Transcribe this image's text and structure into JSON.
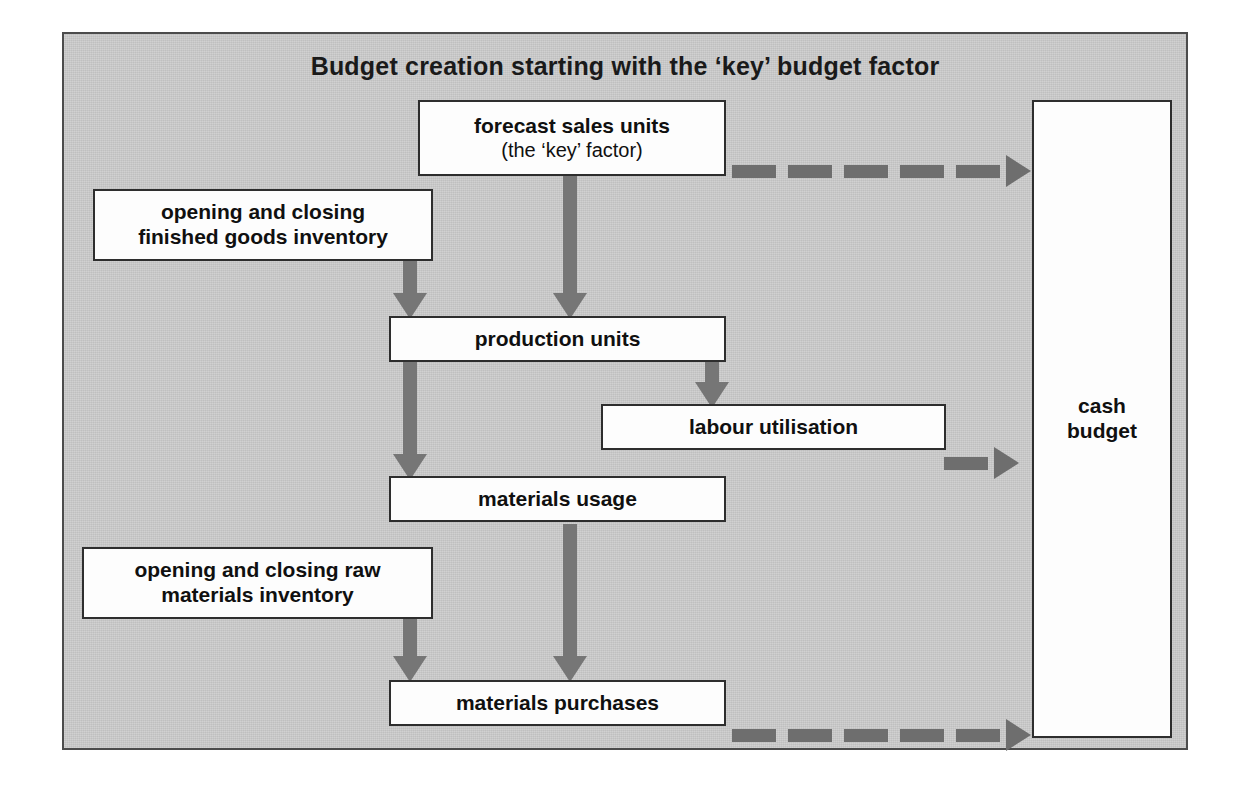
{
  "diagram": {
    "title": "Budget creation starting with the ‘key’ budget factor",
    "type": "flowchart",
    "nodes": {
      "forecast_sales": {
        "line1": "forecast sales units",
        "line2": "(the ‘key’ factor)"
      },
      "fg_inventory": {
        "line1": "opening and closing",
        "line2": "finished goods inventory"
      },
      "production_units": {
        "label": "production units"
      },
      "labour_utilisation": {
        "label": "labour utilisation"
      },
      "materials_usage": {
        "label": "materials usage"
      },
      "rm_inventory": {
        "line1": "opening and closing raw",
        "line2": "materials inventory"
      },
      "materials_purchases": {
        "label": "materials purchases"
      },
      "cash_budget": {
        "line1": "cash",
        "line2": "budget"
      }
    },
    "edges": [
      {
        "from": "forecast_sales",
        "to": "cash_budget",
        "style": "dashed",
        "direction": "right"
      },
      {
        "from": "forecast_sales",
        "to": "production_units",
        "style": "solid",
        "direction": "down"
      },
      {
        "from": "fg_inventory",
        "to": "production_units",
        "style": "solid",
        "direction": "down"
      },
      {
        "from": "production_units",
        "to": "materials_usage",
        "style": "solid",
        "direction": "down"
      },
      {
        "from": "production_units",
        "to": "labour_utilisation",
        "style": "solid",
        "direction": "down"
      },
      {
        "from": "labour_utilisation",
        "to": "cash_budget",
        "style": "dashed",
        "direction": "right"
      },
      {
        "from": "materials_usage",
        "to": "materials_purchases",
        "style": "solid",
        "direction": "down"
      },
      {
        "from": "rm_inventory",
        "to": "materials_purchases",
        "style": "solid",
        "direction": "down"
      },
      {
        "from": "materials_purchases",
        "to": "cash_budget",
        "style": "dashed",
        "direction": "right"
      }
    ],
    "colors": {
      "panel_background": "#c9c9c9",
      "panel_border": "#4c4c4c",
      "box_fill": "#fdfdfd",
      "box_border": "#2e2e2e",
      "arrow": "#767676",
      "text": "#101010"
    }
  }
}
